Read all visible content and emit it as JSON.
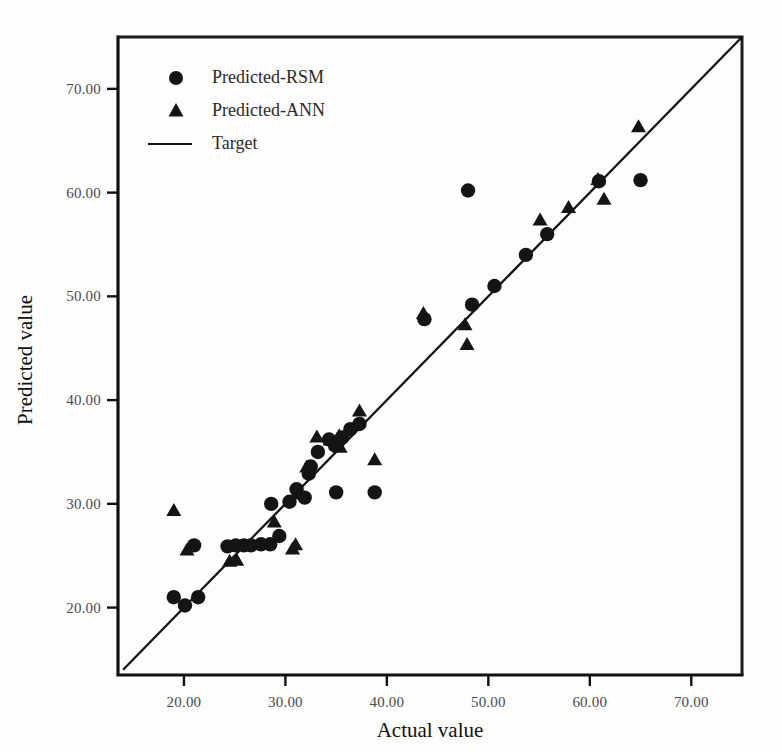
{
  "chart_data": {
    "type": "scatter",
    "title": "",
    "xlabel": "Actual value",
    "ylabel": "Predicted value",
    "xlim": [
      13.5,
      75.0
    ],
    "ylim": [
      13.5,
      75.0
    ],
    "xticks": [
      20,
      30,
      40,
      50,
      60,
      70
    ],
    "yticks": [
      20,
      30,
      40,
      50,
      60,
      70
    ],
    "xticklabels": [
      "20.00",
      "30.00",
      "40.00",
      "50.00",
      "60.00",
      "70.00"
    ],
    "yticklabels": [
      "20.00",
      "30.00",
      "40.00",
      "50.00",
      "60.00",
      "70.00"
    ],
    "grid": false,
    "legend_position": "upper-left",
    "series": [
      {
        "name": "Predicted-RSM",
        "marker": "circle",
        "color": "#141414",
        "points": [
          [
            19.0,
            21.0
          ],
          [
            20.1,
            20.2
          ],
          [
            21.4,
            21.0
          ],
          [
            21.0,
            26.0
          ],
          [
            24.3,
            25.9
          ],
          [
            25.1,
            26.0
          ],
          [
            25.9,
            26.0
          ],
          [
            26.6,
            26.0
          ],
          [
            27.6,
            26.1
          ],
          [
            28.5,
            26.1
          ],
          [
            29.4,
            26.9
          ],
          [
            28.6,
            30.0
          ],
          [
            30.4,
            30.2
          ],
          [
            31.1,
            31.4
          ],
          [
            31.9,
            30.6
          ],
          [
            32.3,
            32.9
          ],
          [
            32.5,
            33.6
          ],
          [
            33.2,
            35.0
          ],
          [
            34.3,
            36.2
          ],
          [
            34.9,
            35.6
          ],
          [
            35.6,
            36.4
          ],
          [
            36.4,
            37.2
          ],
          [
            37.3,
            37.7
          ],
          [
            35.0,
            31.1
          ],
          [
            38.8,
            31.1
          ],
          [
            43.7,
            47.8
          ],
          [
            48.0,
            60.2
          ],
          [
            48.4,
            49.2
          ],
          [
            50.6,
            51.0
          ],
          [
            53.7,
            54.0
          ],
          [
            55.8,
            56.0
          ],
          [
            60.9,
            61.1
          ],
          [
            65.0,
            61.2
          ]
        ]
      },
      {
        "name": "Predicted-ANN",
        "marker": "triangle",
        "color": "#141414",
        "points": [
          [
            19.0,
            29.3
          ],
          [
            20.3,
            25.5
          ],
          [
            24.5,
            24.4
          ],
          [
            25.2,
            24.5
          ],
          [
            28.9,
            28.2
          ],
          [
            30.7,
            25.6
          ],
          [
            31.0,
            26.0
          ],
          [
            31.4,
            30.9
          ],
          [
            32.1,
            33.5
          ],
          [
            33.1,
            36.4
          ],
          [
            34.4,
            36.1
          ],
          [
            35.3,
            36.5
          ],
          [
            35.4,
            35.4
          ],
          [
            37.3,
            38.9
          ],
          [
            38.8,
            34.2
          ],
          [
            43.6,
            48.3
          ],
          [
            47.7,
            47.2
          ],
          [
            47.9,
            45.3
          ],
          [
            55.1,
            57.3
          ],
          [
            57.9,
            58.5
          ],
          [
            61.4,
            59.3
          ],
          [
            60.8,
            61.2
          ],
          [
            64.8,
            66.3
          ]
        ]
      }
    ],
    "reference_line": {
      "name": "Target",
      "type": "identity",
      "from": [
        14.0,
        14.0
      ],
      "to": [
        75.0,
        75.0
      ],
      "color": "#141414"
    },
    "legend_entries": [
      {
        "label": "Predicted-RSM",
        "marker": "circle"
      },
      {
        "label": "Predicted-ANN",
        "marker": "triangle"
      },
      {
        "label": "Target",
        "marker": "line"
      }
    ]
  }
}
